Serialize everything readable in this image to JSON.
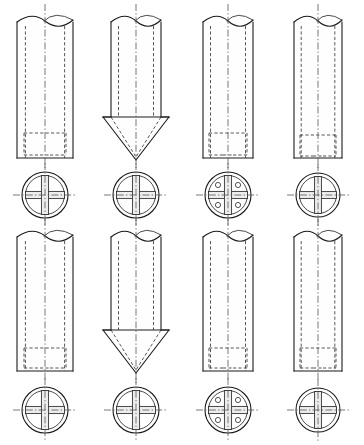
{
  "sheet": {
    "title": "Cylindrical Pile Shaft Engineering Drawing Sheet",
    "description": "Technical line drawing: eight cylindrical pile/shaft members arranged in two rows of four, each elevation view paired with a circular cross-section below showing an internal cruciform rib.",
    "width": 364,
    "height": 445,
    "background_color": "#ffffff",
    "line_color": "#1a1a1a",
    "hidden_line_color": "#3a3a3a",
    "center_line_color": "#555555",
    "rib_fill_color": "#ededed",
    "rows": 2,
    "columns": 4,
    "total_figures": 8
  },
  "legend": {
    "solid_line_meaning": "visible edge",
    "dashed_line_meaning": "hidden edge",
    "dash_dot_line_meaning": "center axis",
    "break_symbol_meaning": "broken-off cylinder top"
  },
  "figures": [
    {
      "id": "figure-1",
      "row": 1,
      "column": 1,
      "tip_type": "flat",
      "cross_section_type": "cruciform",
      "cross_section_holes": 0,
      "elevation": {
        "center_x": 45,
        "top_y": 22,
        "bottom_y": 158,
        "half_width": 28,
        "tip_half_width": 28,
        "tip_apex_y": 158
      },
      "cavity": {
        "top_y": 133,
        "bottom_y": 155,
        "half_width": 21
      },
      "section": {
        "center_x": 45,
        "center_y": 195,
        "outer_r": 23,
        "inner_r": 19.5,
        "bar_half": 3.6
      }
    },
    {
      "id": "figure-2",
      "row": 1,
      "column": 2,
      "tip_type": "conical-point",
      "cross_section_type": "cruciform",
      "cross_section_holes": 0,
      "elevation": {
        "center_x": 136,
        "top_y": 22,
        "bottom_y": 117,
        "half_width": 25,
        "tip_half_width": 33,
        "tip_apex_y": 160
      },
      "cavity": null,
      "section": {
        "center_x": 136,
        "center_y": 195,
        "outer_r": 23,
        "inner_r": 19.5,
        "bar_half": 3.6
      }
    },
    {
      "id": "figure-3",
      "row": 1,
      "column": 3,
      "tip_type": "flat",
      "cross_section_type": "cruciform-with-holes",
      "cross_section_holes": 4,
      "elevation": {
        "center_x": 228,
        "top_y": 22,
        "bottom_y": 158,
        "half_width": 25,
        "tip_half_width": 25,
        "tip_apex_y": 158
      },
      "cavity": {
        "top_y": 133,
        "bottom_y": 155,
        "half_width": 19
      },
      "section": {
        "center_x": 228,
        "center_y": 195,
        "outer_r": 23,
        "inner_r": 19.5,
        "bar_half": 3.6,
        "hole_r": 2.6,
        "hole_offset": 10
      }
    },
    {
      "id": "figure-4",
      "row": 1,
      "column": 4,
      "tip_type": "flat",
      "cross_section_type": "cruciform",
      "cross_section_holes": 0,
      "elevation": {
        "center_x": 318,
        "top_y": 22,
        "bottom_y": 158,
        "half_width": 24,
        "tip_half_width": 24,
        "tip_apex_y": 158
      },
      "cavity": {
        "top_y": 135,
        "bottom_y": 156,
        "half_width": 18
      },
      "section": {
        "center_x": 318,
        "center_y": 195,
        "outer_r": 22,
        "inner_r": 18.5,
        "bar_half": 3.4
      }
    },
    {
      "id": "figure-5",
      "row": 2,
      "column": 1,
      "tip_type": "flat",
      "cross_section_type": "cruciform",
      "cross_section_holes": 0,
      "elevation": {
        "center_x": 45,
        "top_y": 237,
        "bottom_y": 371,
        "half_width": 28,
        "tip_half_width": 28,
        "tip_apex_y": 371
      },
      "cavity": {
        "top_y": 348,
        "bottom_y": 368,
        "half_width": 21
      },
      "section": {
        "center_x": 45,
        "center_y": 410,
        "outer_r": 23,
        "inner_r": 19.5,
        "bar_half": 3.6
      }
    },
    {
      "id": "figure-6",
      "row": 2,
      "column": 2,
      "tip_type": "conical-point",
      "cross_section_type": "cruciform",
      "cross_section_holes": 0,
      "elevation": {
        "center_x": 136,
        "top_y": 237,
        "bottom_y": 330,
        "half_width": 25,
        "tip_half_width": 33,
        "tip_apex_y": 373
      },
      "cavity": null,
      "section": {
        "center_x": 136,
        "center_y": 410,
        "outer_r": 23,
        "inner_r": 19.5,
        "bar_half": 3.6
      }
    },
    {
      "id": "figure-7",
      "row": 2,
      "column": 3,
      "tip_type": "flat",
      "cross_section_type": "cruciform-with-holes",
      "cross_section_holes": 4,
      "elevation": {
        "center_x": 228,
        "top_y": 237,
        "bottom_y": 371,
        "half_width": 25,
        "tip_half_width": 25,
        "tip_apex_y": 371
      },
      "cavity": {
        "top_y": 348,
        "bottom_y": 368,
        "half_width": 19
      },
      "section": {
        "center_x": 228,
        "center_y": 410,
        "outer_r": 23,
        "inner_r": 19.5,
        "bar_half": 3.6,
        "hole_r": 2.6,
        "hole_offset": 10
      }
    },
    {
      "id": "figure-8",
      "row": 2,
      "column": 4,
      "tip_type": "flat",
      "cross_section_type": "cruciform",
      "cross_section_holes": 0,
      "elevation": {
        "center_x": 318,
        "top_y": 237,
        "bottom_y": 371,
        "half_width": 24,
        "tip_half_width": 24,
        "tip_apex_y": 371
      },
      "cavity": {
        "top_y": 348,
        "bottom_y": 368,
        "half_width": 18
      },
      "section": {
        "center_x": 318,
        "center_y": 410,
        "outer_r": 22,
        "inner_r": 18.5,
        "bar_half": 3.4
      }
    }
  ]
}
